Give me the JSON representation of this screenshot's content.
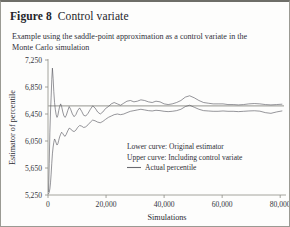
{
  "figure": {
    "number_label": "Figure 8",
    "title": "Control variate",
    "caption": "Example using the saddle-point approximation as a control variate in the Monte Carlo simulation"
  },
  "legend": {
    "lower_note": "Lower curve: Original estimator",
    "upper_note": "Upper curve: Including control variate",
    "actual_label": "Actual percentile"
  },
  "chart_data": {
    "type": "line",
    "title": "Control variate",
    "xlabel": "Simulations",
    "ylabel": "Estimator of percentile",
    "xlim": [
      0,
      82000
    ],
    "ylim": [
      5250,
      7250
    ],
    "grid": false,
    "legend_position": "inside-right",
    "xticks": [
      0,
      20000,
      40000,
      60000,
      80000
    ],
    "xtick_labels": [
      "0",
      "20,000",
      "40,000",
      "60,000",
      "80,000"
    ],
    "yticks": [
      5250,
      5650,
      6050,
      6450,
      6850,
      7250
    ],
    "ytick_labels": [
      "5,250",
      "5,650",
      "6,050",
      "6,450",
      "6,850",
      "7,250"
    ],
    "annotations": [
      "Lower curve: Original estimator",
      "Upper curve: Including control variate",
      "Actual percentile"
    ],
    "reference_line": {
      "name": "Actual percentile",
      "orientation": "horizontal",
      "y": 6570,
      "color": "#a9a9a4"
    },
    "series": [
      {
        "name": "Including control variate",
        "role": "upper curve",
        "color": "#55555c",
        "x": [
          200,
          420,
          640,
          860,
          1080,
          1300,
          1520,
          1760,
          2000,
          2260,
          2520,
          2800,
          3100,
          3400,
          3700,
          4000,
          4350,
          4700,
          5100,
          5500,
          5900,
          6300,
          6800,
          7300,
          7800,
          8400,
          9000,
          9600,
          10200,
          10900,
          11600,
          12300,
          13000,
          13800,
          14600,
          15400,
          16200,
          17100,
          18000,
          18900,
          19800,
          20800,
          21800,
          22800,
          23900,
          25000,
          26100,
          27200,
          28400,
          29600,
          30800,
          32000,
          33300,
          34600,
          35900,
          37200,
          38600,
          40000,
          41400,
          42800,
          44300,
          45800,
          47300,
          48800,
          50400,
          52000,
          53600,
          55200,
          56900,
          58600,
          60300,
          62000,
          63800,
          65600,
          67400,
          69200,
          71100,
          73000,
          74900,
          76800,
          78700,
          80600
        ],
        "y": [
          5300,
          5720,
          6180,
          6480,
          6700,
          6960,
          7130,
          6980,
          6780,
          6620,
          6520,
          6440,
          6400,
          6430,
          6500,
          6560,
          6600,
          6560,
          6480,
          6420,
          6400,
          6430,
          6500,
          6560,
          6520,
          6450,
          6410,
          6440,
          6500,
          6540,
          6490,
          6430,
          6420,
          6460,
          6520,
          6570,
          6540,
          6480,
          6450,
          6480,
          6530,
          6560,
          6600,
          6620,
          6600,
          6580,
          6610,
          6640,
          6650,
          6630,
          6640,
          6660,
          6650,
          6630,
          6620,
          6640,
          6630,
          6600,
          6590,
          6600,
          6620,
          6650,
          6700,
          6720,
          6690,
          6650,
          6620,
          6610,
          6600,
          6600,
          6600,
          6590,
          6590,
          6585,
          6590,
          6600,
          6605,
          6600,
          6590,
          6585,
          6590,
          6595
        ]
      },
      {
        "name": "Original estimator",
        "role": "lower curve",
        "color": "#55555c",
        "x": [
          200,
          420,
          640,
          860,
          1080,
          1300,
          1520,
          1760,
          2000,
          2260,
          2520,
          2800,
          3100,
          3400,
          3700,
          4000,
          4350,
          4700,
          5100,
          5500,
          5900,
          6300,
          6800,
          7300,
          7800,
          8400,
          9000,
          9600,
          10200,
          10900,
          11600,
          12300,
          13000,
          13800,
          14600,
          15400,
          16200,
          17100,
          18000,
          18900,
          19800,
          20800,
          21800,
          22800,
          23900,
          25000,
          26100,
          27200,
          28400,
          29600,
          30800,
          32000,
          33300,
          34600,
          35900,
          37200,
          38600,
          40000,
          41400,
          42800,
          44300,
          45800,
          47300,
          48800,
          50400,
          52000,
          53600,
          55200,
          56900,
          58600,
          60300,
          62000,
          63800,
          65600,
          67400,
          69200,
          71100,
          73000,
          74900,
          76800,
          78700,
          80600
        ],
        "y": [
          5270,
          5290,
          5340,
          5430,
          5560,
          5720,
          5860,
          5960,
          6030,
          6080,
          6060,
          6020,
          5990,
          6010,
          6060,
          6110,
          6150,
          6180,
          6160,
          6130,
          6120,
          6150,
          6200,
          6240,
          6230,
          6200,
          6190,
          6210,
          6250,
          6280,
          6270,
          6250,
          6260,
          6290,
          6330,
          6360,
          6350,
          6330,
          6320,
          6340,
          6370,
          6400,
          6420,
          6440,
          6450,
          6440,
          6450,
          6470,
          6490,
          6500,
          6510,
          6520,
          6510,
          6500,
          6495,
          6505,
          6500,
          6490,
          6485,
          6490,
          6500,
          6520,
          6560,
          6580,
          6550,
          6520,
          6500,
          6495,
          6490,
          6490,
          6495,
          6490,
          6490,
          6485,
          6490,
          6495,
          6498,
          6492,
          6470,
          6460,
          6480,
          6495
        ]
      }
    ]
  }
}
